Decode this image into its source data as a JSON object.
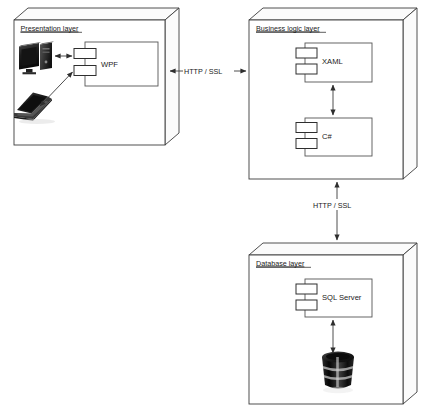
{
  "diagram": {
    "type": "uml-deployment-layer-diagram",
    "background_color": "#ffffff",
    "line_color": "#3c3c3c",
    "nodes": [
      {
        "id": "presentation",
        "title": "Presentation layer",
        "components": [
          {
            "id": "wpf",
            "label": "WPF",
            "symbol": "uml-component"
          }
        ],
        "devices": [
          {
            "id": "desktop",
            "icon": "desktop-computer-icon"
          },
          {
            "id": "laptop",
            "icon": "laptop-computer-icon"
          }
        ]
      },
      {
        "id": "business",
        "title": "Business logic layer",
        "components": [
          {
            "id": "xaml",
            "label": "XAML",
            "symbol": "uml-component"
          },
          {
            "id": "csharp",
            "label": "C#",
            "symbol": "uml-component"
          }
        ],
        "devices": []
      },
      {
        "id": "database",
        "title": "Database layer",
        "components": [
          {
            "id": "sqlserver",
            "label": "SQL Server",
            "symbol": "uml-component"
          }
        ],
        "devices": [
          {
            "id": "db-store",
            "icon": "database-cylinder-icon"
          }
        ]
      }
    ],
    "connectors": [
      {
        "id": "presentation-business",
        "label": "HTTP / SSL",
        "orientation": "horizontal",
        "arrows": "both",
        "from": "presentation",
        "to": "business"
      },
      {
        "id": "business-database",
        "label": "HTTP / SSL",
        "orientation": "vertical",
        "arrows": "both",
        "from": "business",
        "to": "database"
      },
      {
        "id": "xaml-csharp",
        "label": "",
        "orientation": "vertical",
        "arrows": "both",
        "from": "xaml",
        "to": "csharp"
      },
      {
        "id": "sqlserver-store",
        "label": "",
        "orientation": "vertical",
        "arrows": "both",
        "from": "sqlserver",
        "to": "db-store"
      },
      {
        "id": "wpf-desktop",
        "label": "",
        "orientation": "horizontal",
        "arrows": "both",
        "from": "wpf",
        "to": "desktop"
      },
      {
        "id": "wpf-laptop",
        "label": "",
        "orientation": "diagonal",
        "arrows": "both",
        "from": "wpf",
        "to": "laptop"
      }
    ]
  }
}
